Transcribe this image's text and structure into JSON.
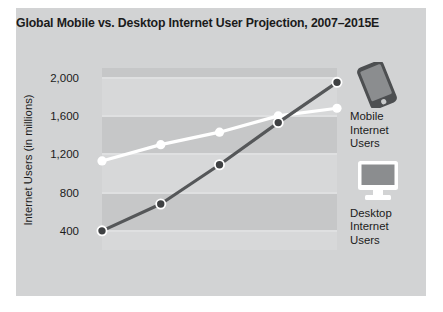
{
  "chart_data": {
    "type": "line",
    "title": "Global Mobile vs. Desktop Internet User Projection, 2007–2015E",
    "xlabel": "",
    "ylabel": "Internet Users (in millions)",
    "categories": [
      "2007",
      "2009",
      "2011E",
      "2013E",
      "2015E"
    ],
    "ylim": [
      200,
      2100
    ],
    "yticks": [
      400,
      800,
      1200,
      1600,
      2000
    ],
    "ytick_labels": [
      "400",
      "800",
      "1,200",
      "1,600",
      "2,000"
    ],
    "grid": true,
    "legend_position": "right",
    "series": [
      {
        "name": "Mobile Internet Users",
        "values": [
          400,
          680,
          1090,
          1530,
          1950
        ],
        "color": "#555759",
        "marker": "circle-dark-white-ring"
      },
      {
        "name": "Desktop Internet Users",
        "values": [
          1130,
          1300,
          1430,
          1600,
          1680
        ],
        "color": "#ffffff",
        "marker": "circle-white"
      }
    ]
  },
  "legend": {
    "items": [
      {
        "icon": "smartphone-icon",
        "lines": [
          "Mobile",
          "Internet",
          "Users"
        ]
      },
      {
        "icon": "desktop-monitor-icon",
        "lines": [
          "Desktop",
          "Internet",
          "Users"
        ]
      }
    ]
  },
  "colors": {
    "card_background": "#d2d3d4",
    "plot_background": "#c6c7c8",
    "plot_band": "#d7d8d9",
    "gridline": "#dfe0e1",
    "text": "#1b1b1b",
    "mobile_series": "#555759",
    "desktop_series": "#ffffff"
  }
}
